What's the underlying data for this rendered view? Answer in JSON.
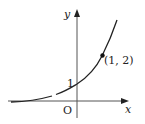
{
  "diagram": {
    "type": "function-graph",
    "axes": {
      "x_label": "x",
      "y_label": "y",
      "origin_label": "O"
    },
    "curve": {
      "kind": "exponential",
      "description": "increasing exponential curve through (0,1) and (1,2)"
    },
    "annotations": {
      "y_intercept_label": "1",
      "point_label": "(1, 2)"
    },
    "colors": {
      "ink": "#222222",
      "background": "#ffffff"
    }
  }
}
